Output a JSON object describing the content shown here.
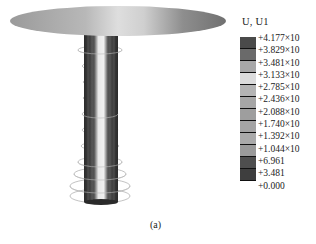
{
  "figure": {
    "caption": "(a)",
    "legend": {
      "title": "U, U1",
      "labels": [
        "+4.177×10",
        "+3.829×10",
        "+3.481×10",
        "+3.133×10",
        "+2.785×10",
        "+2.436×10",
        "+2.088×10",
        "+1.740×10",
        "+1.392×10",
        "+1.044×10",
        "+6.961",
        "+3.481",
        "+0.000"
      ],
      "colors": [
        "#4a4a4a",
        "#6a6a6a",
        "#a8a8a8",
        "#dcdcdc",
        "#b4b4b4",
        "#a6a6a6",
        "#9e9e9e",
        "#a4a4a4",
        "#aaaaaa",
        "#9a9a9a",
        "#4e4e4e",
        "#3e3e3e"
      ]
    },
    "model": {
      "type": "pile-cap contour plot",
      "ring_count": 10
    }
  }
}
